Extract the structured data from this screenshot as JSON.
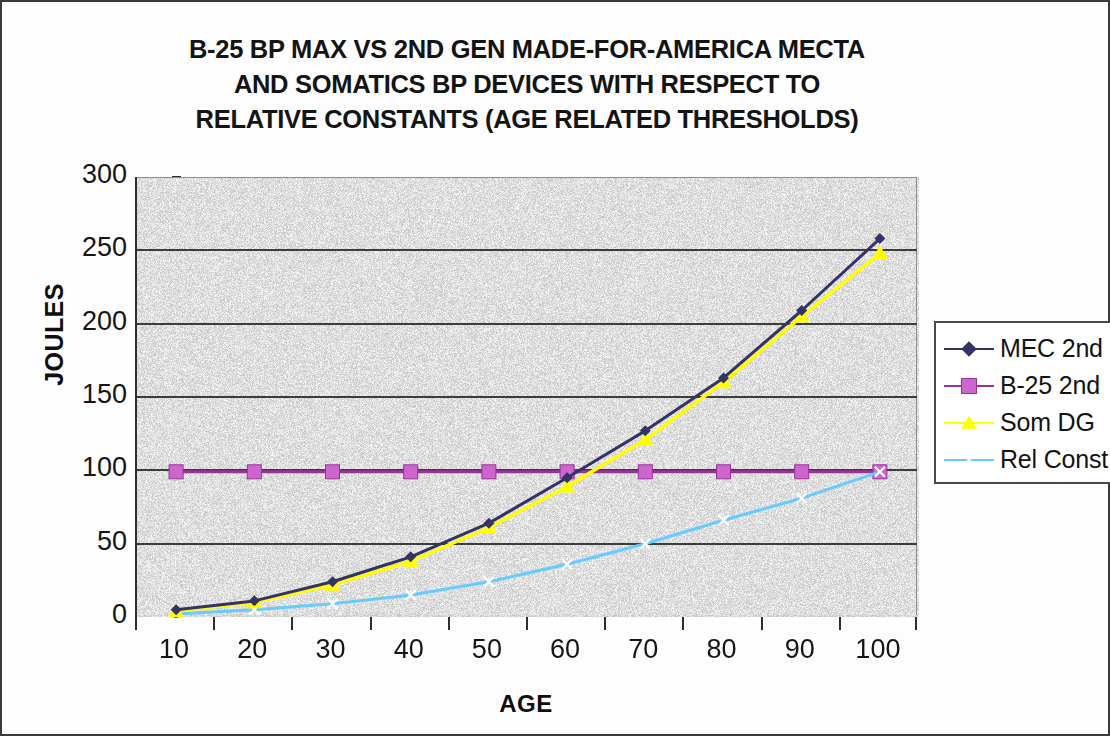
{
  "chart_data": {
    "type": "line",
    "title": "B-25 BP MAX VS 2ND GEN MADE-FOR-AMERICA MECTA AND SOMATICS BP DEVICES WITH RESPECT TO RELATIVE CONSTANTS (AGE RELATED THRESHOLDS)",
    "title_lines": [
      "B-25 BP MAX VS 2ND GEN MADE-FOR-AMERICA MECTA",
      "AND SOMATICS BP DEVICES WITH RESPECT TO",
      "RELATIVE CONSTANTS (AGE RELATED THRESHOLDS)"
    ],
    "xlabel": "AGE",
    "ylabel": "JOULES",
    "categories": [
      10,
      20,
      30,
      40,
      50,
      60,
      70,
      80,
      90,
      100
    ],
    "xtick_labels": [
      "10",
      "20",
      "30",
      "40",
      "50",
      "60",
      "70",
      "80",
      "90",
      "100"
    ],
    "ytick_labels": [
      "0",
      "50",
      "100",
      "150",
      "200",
      "250",
      "300"
    ],
    "ylim": [
      0,
      300
    ],
    "ytick_step": 50,
    "grid": "horizontal",
    "legend_position": "right",
    "plot_background": "#d2d2d2",
    "series": [
      {
        "name": "MEC 2nd",
        "color": "#333366",
        "marker": "diamond",
        "values": [
          5,
          11,
          24,
          41,
          64,
          95,
          127,
          163,
          209,
          258
        ]
      },
      {
        "name": "B-25 2nd",
        "color": "#993399",
        "marker": "square",
        "values": [
          99,
          99,
          99,
          99,
          99,
          99,
          99,
          99,
          99,
          99
        ]
      },
      {
        "name": "Som DG",
        "color": "#ffff00",
        "marker": "triangle",
        "values": [
          4,
          10,
          22,
          38,
          61,
          89,
          121,
          160,
          205,
          248
        ]
      },
      {
        "name": "Rel Const",
        "color": "#66ccff",
        "marker": "x",
        "values": [
          2,
          5,
          9,
          15,
          24,
          36,
          50,
          66,
          81,
          99
        ]
      }
    ]
  },
  "legend": {
    "items": [
      {
        "label": "MEC 2nd",
        "color": "#333366",
        "marker": "diamond"
      },
      {
        "label": "B-25 2nd",
        "color": "#993399",
        "marker": "square"
      },
      {
        "label": "Som DG",
        "color": "#ffff00",
        "marker": "triangle"
      },
      {
        "label": "Rel Const",
        "color": "#66ccff",
        "marker": "x"
      }
    ]
  }
}
